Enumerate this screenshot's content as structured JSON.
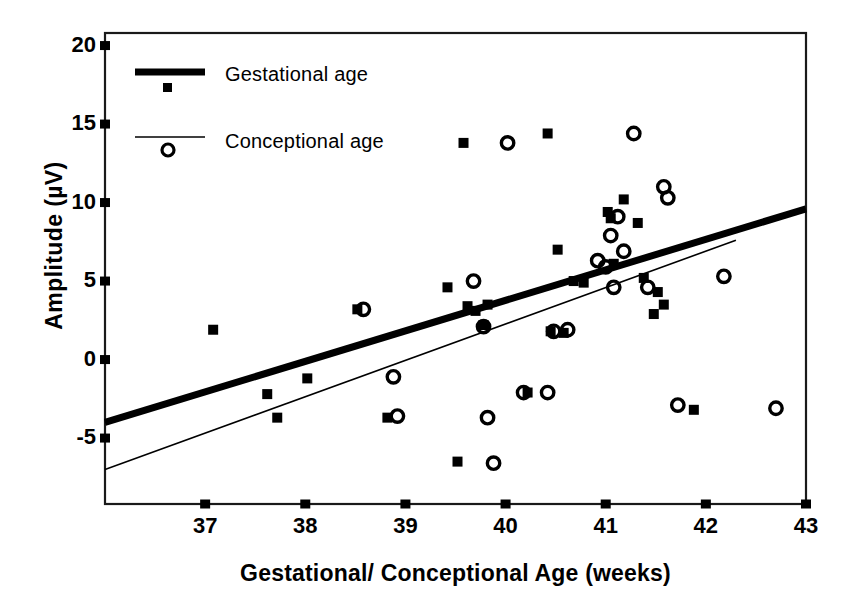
{
  "chart_data": {
    "type": "scatter",
    "title": "",
    "xlabel": "Gestational/ Conceptional Age (weeks)",
    "ylabel": "Amplitude (µV)",
    "xlim": [
      36.0,
      43.0
    ],
    "ylim": [
      -9.2,
      20.8
    ],
    "xticks": [
      37,
      38,
      39,
      40,
      41,
      42,
      43
    ],
    "yticks": [
      20,
      15,
      10,
      5,
      0,
      -5
    ],
    "xtick_labels": [
      "37",
      "38",
      "39",
      "40",
      "41",
      "42",
      "43"
    ],
    "ytick_labels": [
      "20",
      "15",
      "10",
      "5",
      "0",
      "-5"
    ],
    "grid": false,
    "legend_position": "upper-left-inside",
    "series": [
      {
        "name": "Gestational age",
        "marker": "filled-square",
        "color": "#000000",
        "points": [
          [
            37.08,
            1.9
          ],
          [
            37.62,
            -2.2
          ],
          [
            37.72,
            -3.7
          ],
          [
            38.02,
            -1.2
          ],
          [
            38.52,
            3.2
          ],
          [
            38.82,
            -3.7
          ],
          [
            39.42,
            4.6
          ],
          [
            39.52,
            -6.5
          ],
          [
            39.58,
            13.8
          ],
          [
            39.62,
            3.4
          ],
          [
            39.7,
            3.1
          ],
          [
            39.78,
            2.2
          ],
          [
            39.82,
            3.5
          ],
          [
            40.22,
            -2.1
          ],
          [
            40.42,
            14.4
          ],
          [
            40.45,
            1.8
          ],
          [
            40.52,
            7.0
          ],
          [
            40.58,
            1.7
          ],
          [
            40.68,
            5.0
          ],
          [
            40.78,
            4.9
          ],
          [
            41.02,
            9.4
          ],
          [
            41.05,
            9.0
          ],
          [
            41.08,
            6.1
          ],
          [
            41.18,
            10.2
          ],
          [
            41.32,
            8.7
          ],
          [
            41.38,
            5.2
          ],
          [
            41.48,
            2.9
          ],
          [
            41.52,
            4.3
          ],
          [
            41.58,
            3.5
          ],
          [
            41.88,
            -3.2
          ]
        ]
      },
      {
        "name": "Conceptional age",
        "marker": "open-circle",
        "color": "#000000",
        "points": [
          [
            38.58,
            3.2
          ],
          [
            38.88,
            -1.1
          ],
          [
            38.92,
            -3.6
          ],
          [
            39.68,
            5.0
          ],
          [
            39.78,
            2.1
          ],
          [
            39.82,
            -3.7
          ],
          [
            39.88,
            -6.6
          ],
          [
            40.02,
            13.8
          ],
          [
            40.18,
            -2.1
          ],
          [
            40.42,
            -2.1
          ],
          [
            40.48,
            1.8
          ],
          [
            40.62,
            1.9
          ],
          [
            40.92,
            6.3
          ],
          [
            41.0,
            5.9
          ],
          [
            41.05,
            7.9
          ],
          [
            41.08,
            4.6
          ],
          [
            41.12,
            9.1
          ],
          [
            41.18,
            6.9
          ],
          [
            41.28,
            14.4
          ],
          [
            41.42,
            4.6
          ],
          [
            41.58,
            11.0
          ],
          [
            41.62,
            10.3
          ],
          [
            41.72,
            -2.9
          ],
          [
            42.18,
            5.3
          ],
          [
            42.7,
            -3.1
          ]
        ]
      }
    ],
    "trendlines": [
      {
        "name": "Gestational age",
        "style": "thick-solid",
        "width": 7,
        "color": "#000000",
        "x_start": 36.0,
        "y_start": -4.0,
        "x_end": 43.0,
        "y_end": 9.6
      },
      {
        "name": "Conceptional age",
        "style": "thin-solid",
        "width": 1.6,
        "color": "#000000",
        "x_start": 36.0,
        "y_start": -7.0,
        "x_end": 42.3,
        "y_end": 7.6
      }
    ]
  },
  "legend": {
    "items": [
      {
        "label": "Gestational age",
        "marker": "filled-square",
        "line": "thick-solid"
      },
      {
        "label": "Conceptional age",
        "marker": "open-circle",
        "line": "thin-solid"
      }
    ]
  },
  "axes": {
    "frame_color": "#1a1a1a",
    "tick_color": "#000000"
  }
}
